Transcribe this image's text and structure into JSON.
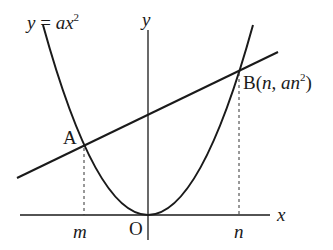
{
  "diagram": {
    "curve_label": {
      "lhs": "y",
      "eq": " = ",
      "rhs": "ax",
      "exp": "2"
    },
    "axis_y_label": "y",
    "axis_x_label": "x",
    "origin_label": "O",
    "point_a": {
      "name": "A"
    },
    "point_b": {
      "name": "B",
      "coord_open": "(",
      "x": "n",
      "sep": ", ",
      "y": "an",
      "exp": "2",
      "coord_close": ")"
    },
    "tick_m": "m",
    "tick_n": "n"
  }
}
